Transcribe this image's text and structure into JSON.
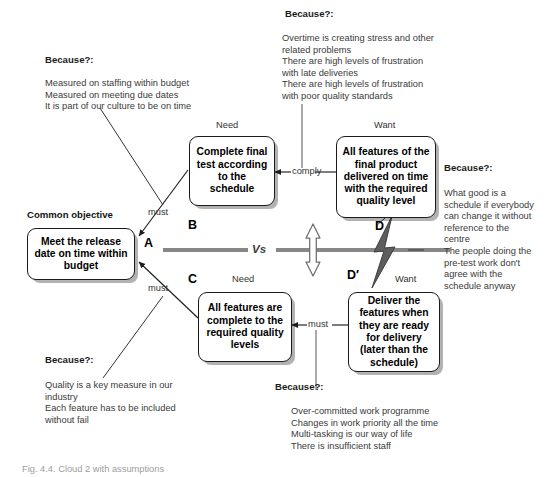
{
  "diagram": {
    "caption": "Fig. 4.4. Cloud 2 with assumptions",
    "vs_label": "Vs",
    "entities": {
      "A": {
        "letter": "A",
        "heading": "Common objective",
        "text": "Meet the release date on time within budget"
      },
      "B": {
        "letter": "B",
        "heading": "Need",
        "text": "Complete final test according to the schedule"
      },
      "C": {
        "letter": "C",
        "heading": "Need",
        "text": "All features are complete to the required quality levels"
      },
      "D": {
        "letter": "D",
        "heading": "Want",
        "text": "All features of the final product delivered on time with the required quality level"
      },
      "Dprime": {
        "letter": "D′",
        "heading": "Want",
        "text": "Deliver the features when they are ready for delivery (later than the schedule)"
      }
    },
    "connectors": {
      "a_b": "must",
      "a_c": "must",
      "b_d": "comply",
      "c_dprime": "must"
    },
    "assumptions": {
      "b": {
        "header": "Because?:",
        "text": "Measured on staffing within budget\nMeasured on meeting due dates\nIt is part of our culture to be on time"
      },
      "d": {
        "header": "Because?:",
        "text": "Overtime is creating stress and other\n  related problems\nThere are high levels of frustration\n  with late deliveries\nThere are high levels of frustration\n  with poor quality standards"
      },
      "d_conflict": {
        "header": "Because?:",
        "text": "What good is a\n  schedule if everybody\n  can change it without\n  reference to the\n  centre\nThe people doing the\n  pre-test work don't\n  agree with the\n  schedule anyway"
      },
      "c": {
        "header": "Because?:",
        "text": "Quality is a key measure in our\n  industry\nEach feature has to be included\n  without fail"
      },
      "dprime": {
        "header": "Because?:",
        "text": "Over-committed work programme\nChanges in work priority all the time\nMulti-tasking is our way of life\nThere is insufficient staff"
      }
    },
    "colors": {
      "line": "#2b2b2b",
      "vs_bar": "#878787",
      "box_border": "#1a1a1a",
      "body_text": "#3a3a3a",
      "caption": "#9d9d9d"
    }
  }
}
